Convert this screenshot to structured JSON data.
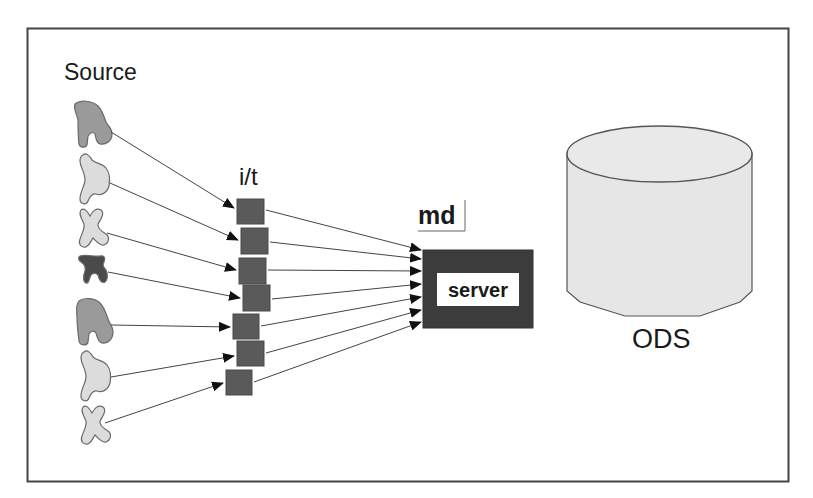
{
  "diagram": {
    "type": "data-flow",
    "labels": {
      "source": "Source",
      "integration_transform": "i/t",
      "metadata": "md",
      "server": "server",
      "ods": "ODS"
    },
    "nodes": {
      "sources": [
        {
          "id": "source-1",
          "shape": "blob-a",
          "fill": "#9a9a9a"
        },
        {
          "id": "source-2",
          "shape": "blob-b",
          "fill": "#dcdcdc"
        },
        {
          "id": "source-3",
          "shape": "blob-x",
          "fill": "#dcdcdc"
        },
        {
          "id": "source-4",
          "shape": "blob-c",
          "fill": "#4a4a4a"
        },
        {
          "id": "source-5",
          "shape": "blob-a",
          "fill": "#9a9a9a"
        },
        {
          "id": "source-6",
          "shape": "blob-b",
          "fill": "#dcdcdc"
        },
        {
          "id": "source-7",
          "shape": "blob-x",
          "fill": "#dcdcdc"
        }
      ],
      "it_boxes": [
        {
          "id": "it-1"
        },
        {
          "id": "it-2"
        },
        {
          "id": "it-3"
        },
        {
          "id": "it-4"
        },
        {
          "id": "it-5"
        },
        {
          "id": "it-6"
        },
        {
          "id": "it-7"
        }
      ],
      "server": {
        "id": "server"
      },
      "ods": {
        "id": "ods",
        "shape": "cylinder"
      }
    },
    "edges": [
      {
        "from": "source-1",
        "to": "it-1"
      },
      {
        "from": "source-2",
        "to": "it-2"
      },
      {
        "from": "source-3",
        "to": "it-3"
      },
      {
        "from": "source-4",
        "to": "it-4"
      },
      {
        "from": "source-5",
        "to": "it-5"
      },
      {
        "from": "source-6",
        "to": "it-6"
      },
      {
        "from": "source-7",
        "to": "it-7"
      },
      {
        "from": "it-1",
        "to": "server"
      },
      {
        "from": "it-2",
        "to": "server"
      },
      {
        "from": "it-3",
        "to": "server"
      },
      {
        "from": "it-4",
        "to": "server"
      },
      {
        "from": "it-5",
        "to": "server"
      },
      {
        "from": "it-6",
        "to": "server"
      },
      {
        "from": "it-7",
        "to": "server"
      }
    ],
    "colors": {
      "frame": "#444444",
      "it_box": "#5a5a5a",
      "server_box": "#3c3c3c",
      "cylinder_fill": "#e6e6e6",
      "cylinder_stroke": "#555555",
      "arrow": "#333333"
    }
  }
}
